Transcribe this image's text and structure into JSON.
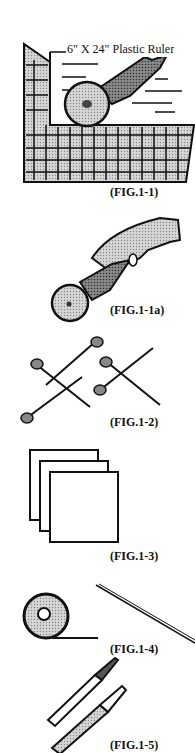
{
  "figures": [
    {
      "id": "fig-1-1",
      "caption": "(FIG.1-1)",
      "label": "6\" X 24\" Plastic Ruler",
      "subject": "rotary cutter cutting along plastic ruler on cutting mat"
    },
    {
      "id": "fig-1-1a",
      "caption": "(FIG.1-1a)",
      "subject": "hand holding rotary cutter"
    },
    {
      "id": "fig-1-2",
      "caption": "(FIG.1-2)",
      "subject": "pins"
    },
    {
      "id": "fig-1-3",
      "caption": "(FIG.1-3)",
      "subject": "stacked paper squares"
    },
    {
      "id": "fig-1-4",
      "caption": "(FIG.1-4)",
      "subject": "tape roll and thread"
    },
    {
      "id": "fig-1-5",
      "caption": "(FIG.1-5)",
      "subject": "marking pens"
    }
  ],
  "colors": {
    "ink": "#111111",
    "screen": "#b8b8b8",
    "dark_screen": "#6e6e6e",
    "paper": "#ffffff"
  }
}
